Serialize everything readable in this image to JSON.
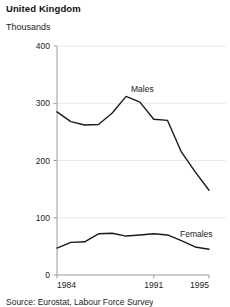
{
  "header": {
    "title": "United Kingdom",
    "subtitle": "Thousands"
  },
  "footer": {
    "source": "Source: Eurostat, Labour Force Survey"
  },
  "chart_data": {
    "type": "line",
    "title": "United Kingdom",
    "subtitle": "Thousands",
    "xlabel": "",
    "ylabel": "Thousands",
    "ylim": [
      0,
      400
    ],
    "xlim": [
      1984,
      1995
    ],
    "yticks": [
      "0",
      "100",
      "200",
      "300",
      "400"
    ],
    "ytick_values": [
      0,
      100,
      200,
      300,
      400
    ],
    "xticks": [
      "1984",
      "1991",
      "1995"
    ],
    "xtick_values": [
      1984,
      1991,
      1995
    ],
    "grid": true,
    "grid_color": "#e8e8e8",
    "legend": "inline-labels",
    "line_color": "#1a1a1a",
    "x": [
      1984,
      1985,
      1986,
      1987,
      1988,
      1989,
      1990,
      1991,
      1992,
      1993,
      1994,
      1995
    ],
    "series": [
      {
        "name": "Males",
        "label": "Males",
        "values": [
          285,
          268,
          262,
          263,
          283,
          312,
          302,
          272,
          270,
          215,
          180,
          148
        ]
      },
      {
        "name": "Females",
        "label": "Females",
        "values": [
          47,
          57,
          58,
          72,
          73,
          68,
          70,
          72,
          70,
          60,
          49,
          45
        ]
      }
    ]
  }
}
